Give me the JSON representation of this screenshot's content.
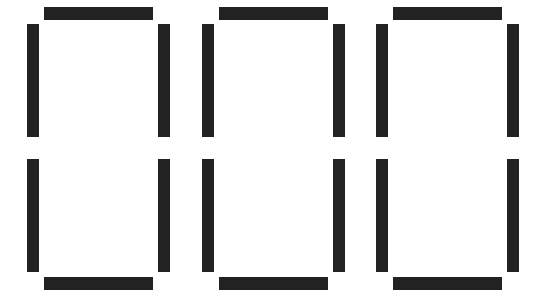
{
  "display": {
    "type": "seven-segment",
    "value": "000",
    "segment_color": "#222222",
    "background_color": "#ffffff",
    "digits": [
      {
        "char": "0",
        "x": 27,
        "segments": {
          "a": true,
          "b": true,
          "c": true,
          "d": true,
          "e": true,
          "f": true,
          "g": false
        }
      },
      {
        "char": "0",
        "x": 202,
        "segments": {
          "a": true,
          "b": true,
          "c": true,
          "d": true,
          "e": true,
          "f": true,
          "g": false
        }
      },
      {
        "char": "0",
        "x": 376,
        "segments": {
          "a": true,
          "b": true,
          "c": true,
          "d": true,
          "e": true,
          "f": true,
          "g": false
        }
      }
    ]
  }
}
